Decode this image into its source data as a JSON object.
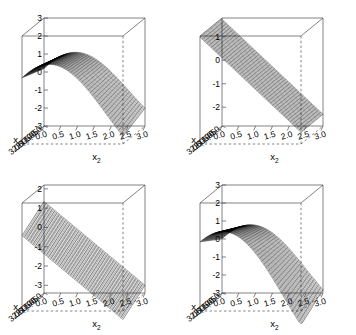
{
  "figure": {
    "kind": "panel-grid-3d-wireframe-surfaces",
    "rows": 2,
    "cols": 2,
    "background": "#ffffff",
    "line_color": "#000000",
    "box_color": "#4d4d4d"
  },
  "chart_data": [
    {
      "type": "line",
      "panel": "top-left",
      "plot_style": "3d-perspective-wireframe-surface",
      "title": "",
      "xlabel": "x",
      "xlabel_sub": "2",
      "ylabel": "x",
      "ylabel_sub": "1",
      "zlabel": "",
      "x_ticks": [
        "0.0",
        "0.5",
        "1.0",
        "1.5",
        "2.0",
        "2.5",
        "3.0"
      ],
      "y_ticks": [
        "0.0",
        "0.5",
        "1.0",
        "1.5",
        "2.0",
        "2.5",
        "3.0"
      ],
      "z_ticks": [
        "3",
        "2",
        "1",
        "0",
        "-1",
        "-2",
        "-3"
      ],
      "xlim": [
        0,
        3
      ],
      "ylim": [
        0,
        3
      ],
      "zlim": [
        -3,
        3
      ],
      "grid": false,
      "legend": "none",
      "surface": {
        "form": "wave",
        "amp_x": 2.3,
        "amp_y": 0.9,
        "freq": 1.05,
        "phase": 0.15,
        "tilt": -0.55,
        "offset": -0.15
      }
    },
    {
      "type": "line",
      "panel": "top-right",
      "plot_style": "3d-perspective-wireframe-surface",
      "title": "",
      "xlabel": "x",
      "xlabel_sub": "2",
      "ylabel": "x",
      "ylabel_sub": "1",
      "zlabel": "",
      "x_ticks": [
        "0.0",
        "0.5",
        "1.0",
        "1.5",
        "2.0",
        "2.5",
        "3.0"
      ],
      "y_ticks": [
        "0.0",
        "0.5",
        "1.0",
        "1.5",
        "2.0",
        "2.5",
        "3.0"
      ],
      "z_ticks": [
        "1",
        "0",
        "-1",
        "-2"
      ],
      "xlim": [
        0,
        3
      ],
      "ylim": [
        0,
        3
      ],
      "zlim": [
        -2.8,
        1.8
      ],
      "grid": false,
      "legend": "none",
      "surface": {
        "form": "plane",
        "slope_x": -1.35,
        "slope_y": 0.0,
        "offset": 1.75
      }
    },
    {
      "type": "line",
      "panel": "bottom-left",
      "plot_style": "3d-perspective-wireframe-surface",
      "title": "",
      "xlabel": "x",
      "xlabel_sub": "2",
      "ylabel": "x",
      "ylabel_sub": "1",
      "zlabel": "",
      "x_ticks": [
        "0.0",
        "0.5",
        "1.0",
        "1.5",
        "2.0",
        "2.5",
        "3.0"
      ],
      "y_ticks": [
        "0.0",
        "0.5",
        "1.0",
        "1.5",
        "2.0",
        "2.5",
        "3.0"
      ],
      "z_ticks": [
        "2",
        "1",
        "0",
        "-1",
        "-2",
        "-3"
      ],
      "xlim": [
        0,
        3
      ],
      "ylim": [
        0,
        3
      ],
      "zlim": [
        -3.4,
        2.2
      ],
      "grid": false,
      "legend": "none",
      "surface": {
        "form": "ruled-plane",
        "slope_x": -1.45,
        "slope_y": -0.28,
        "offset": 1.35
      }
    },
    {
      "type": "line",
      "panel": "bottom-right",
      "plot_style": "3d-perspective-wireframe-surface",
      "title": "",
      "xlabel": "x",
      "xlabel_sub": "2",
      "ylabel": "x",
      "ylabel_sub": "1",
      "zlabel": "",
      "x_ticks": [
        "0.0",
        "0.5",
        "1.0",
        "1.5",
        "2.0",
        "2.5",
        "3.0"
      ],
      "y_ticks": [
        "0.0",
        "0.5",
        "1.0",
        "1.5",
        "2.0",
        "2.5",
        "3.0"
      ],
      "z_ticks": [
        "3",
        "2",
        "1",
        "0",
        "-1",
        "-2",
        "-3"
      ],
      "xlim": [
        0,
        3
      ],
      "ylim": [
        0,
        3
      ],
      "zlim": [
        -3,
        3
      ],
      "grid": false,
      "legend": "none",
      "surface": {
        "form": "wave",
        "amp_x": 2.4,
        "amp_y": 1.55,
        "freq": 1.05,
        "phase": 0.15,
        "tilt": -0.75,
        "offset": -0.35
      }
    }
  ]
}
